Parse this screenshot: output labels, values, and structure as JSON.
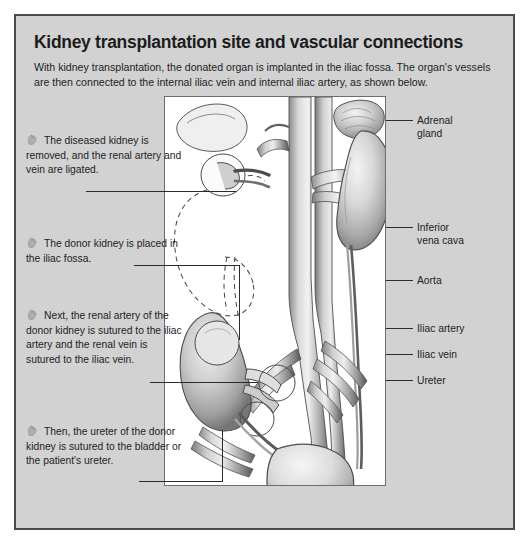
{
  "panel": {
    "title": "Kidney transplantation site and vascular connections",
    "intro": "With kidney transplantation, the donated organ is implanted in the iliac fossa. The organ's vessels are then connected to the internal iliac vein and internal iliac artery, as shown below."
  },
  "steps": [
    {
      "number": "1",
      "text": "The diseased kidney is removed, and the renal artery and vein are ligated."
    },
    {
      "number": "2",
      "text": "The donor kidney is placed in the iliac fossa."
    },
    {
      "number": "3",
      "text": "Next, the renal artery of the donor kidney is sutured to the iliac artery and the renal vein is sutured to the iliac vein."
    },
    {
      "number": "4",
      "text": "Then, the ureter of the donor kidney is sutured to the bladder or the patient's ureter."
    }
  ],
  "labels": {
    "adrenal_gland": "Adrenal\ngland",
    "inferior_vena_cava": "Inferior\nvena cava",
    "aorta": "Aorta",
    "iliac_artery": "Iliac artery",
    "iliac_vein": "Iliac vein",
    "ureter": "Ureter"
  },
  "colors": {
    "panel_background": "#d2d2d2",
    "panel_border": "#4a4a4a",
    "text": "#1d1d1d",
    "illustration_background": "#ffffff",
    "leader_line": "#2b2b2b"
  },
  "illustration": {
    "name": "kidney-transplantation-anatomy",
    "elements": [
      "dashed-outline-removed-left-kidney",
      "right-kidney",
      "adrenal-gland",
      "inferior-vena-cava",
      "aorta",
      "iliac-artery",
      "iliac-vein",
      "transplanted-donor-kidney",
      "ureter",
      "bladder"
    ]
  }
}
